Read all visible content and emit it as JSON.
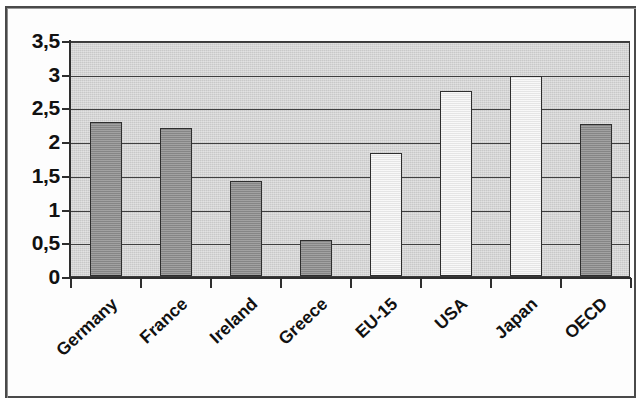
{
  "chart_data": {
    "type": "bar",
    "title": "",
    "subtitle": "",
    "xlabel": "",
    "ylabel": "",
    "categories": [
      "Germany",
      "France",
      "Ireland",
      "Greece",
      "EU-15",
      "USA",
      "Japan",
      "OECD"
    ],
    "values": [
      2.28,
      2.2,
      1.41,
      0.53,
      1.83,
      2.74,
      2.96,
      2.25
    ],
    "series": [
      {
        "name": "",
        "values": [
          2.28,
          2.2,
          1.41,
          0.53,
          1.83,
          2.74,
          2.96,
          2.25
        ]
      }
    ],
    "bar_styles": [
      "dark",
      "dark",
      "dark",
      "dark",
      "light",
      "light",
      "light",
      "dark"
    ],
    "ylim": [
      0,
      3.5
    ],
    "ytick_values": [
      0,
      0.5,
      1,
      1.5,
      2,
      2.5,
      3,
      3.5
    ],
    "ytick_labels": [
      "0",
      "0,5",
      "1",
      "1,5",
      "2",
      "2,5",
      "3",
      "3,5"
    ],
    "decimal_separator": ",",
    "grid": true,
    "grid_axis": "y",
    "legend": false,
    "legend_position": "none",
    "xtick_rotation_degrees": -43,
    "colors": {
      "plot_background": "#c8c8c8",
      "bar_dark": "#8d8d8d",
      "bar_light": "#f1f1f1",
      "bar_outline": "#2e2e2e",
      "gridline": "#3f3f3f",
      "axis": "#2e2e2e",
      "text": "#111111",
      "page_background": "#ffffff",
      "frame": "#4a4a4a"
    }
  }
}
